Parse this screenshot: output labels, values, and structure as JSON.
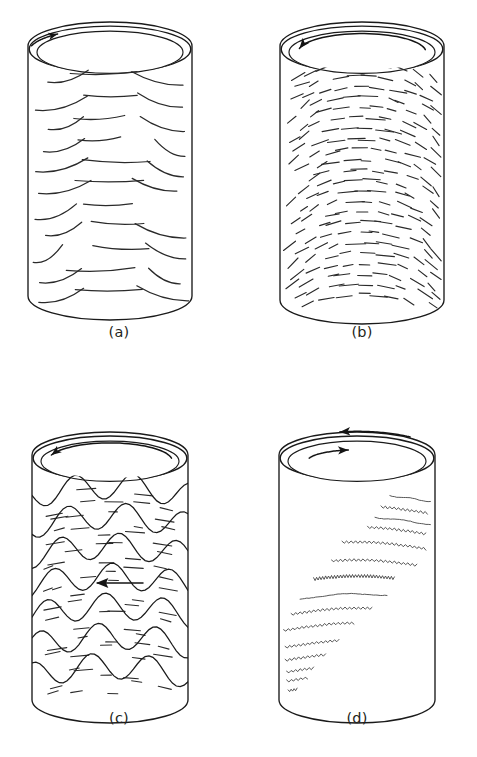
{
  "figure": {
    "background_color": "#ffffff",
    "ink_color": "#1a1a1a",
    "caption_color": "#231f20",
    "width": 477,
    "height": 757
  },
  "panels": [
    {
      "id": "a",
      "caption": "(a)",
      "caption_x": 119,
      "caption_y": 337,
      "structure_name": "parallel-lamination",
      "geometry": {
        "cx": 110,
        "top_y": 46,
        "bottom_y": 296,
        "radius_x": 82,
        "radius_y": 24,
        "rim_gap": 7,
        "inner_inset": 9
      },
      "texture": {
        "type": "sparse-curved-dashes",
        "rows": 11,
        "row_start_y": 74,
        "row_spacing": 21.5,
        "dashes_per_row": 3,
        "dash_length_center": 62,
        "dash_length_edge": 38,
        "stroke_width": 1.25,
        "jitter_seed": 11
      },
      "arrows": [
        {
          "name": "top-rim-flow-arrow",
          "style": "short-arc",
          "direction": "clockwise",
          "start_angle": 196,
          "sweep_angle": 34,
          "radius_scale": 0.995,
          "head_size": 4.6
        }
      ]
    },
    {
      "id": "b",
      "caption": "(b)",
      "caption_x": 362,
      "caption_y": 337,
      "structure_name": "dense-laminated-bioturbated",
      "geometry": {
        "cx": 362,
        "top_y": 46,
        "bottom_y": 300,
        "radius_x": 82,
        "radius_y": 24,
        "rim_gap": 7,
        "inner_inset": 9
      },
      "texture": {
        "type": "dense-short-dashes",
        "rows": 23,
        "row_start_y": 66,
        "row_spacing": 10.4,
        "dashes_per_row": 9,
        "dash_length_center": 17,
        "dash_length_edge": 12,
        "stroke_width": 1.15,
        "jitter_seed": 23
      },
      "arrows": [
        {
          "name": "top-rim-flow-arrow",
          "style": "long-arc",
          "direction": "counterclockwise",
          "start_angle": 352,
          "sweep_angle": 160,
          "radius_scale": 0.78,
          "head_size": 5.2
        }
      ]
    },
    {
      "id": "c",
      "caption": "(c)",
      "caption_x": 119,
      "caption_y": 723,
      "structure_name": "wavy-undulating-bedding",
      "geometry": {
        "cx": 110,
        "top_y": 455,
        "bottom_y": 700,
        "radius_x": 78,
        "radius_y": 23,
        "rim_gap": 7,
        "inner_inset": 9
      },
      "texture": {
        "type": "wavy-bedding-with-dashes",
        "bedding_count": 7,
        "bedding_start_y": 486,
        "bedding_spacing": 30,
        "wave_amplitude": 13,
        "wave_cycles": 1.35,
        "wave_phase": 0.35,
        "dash_rows_between": 2,
        "dashes_per_row": 5,
        "dash_length": 14,
        "stroke_width": 1.1,
        "jitter_seed": 37
      },
      "arrows": [
        {
          "name": "top-rim-flow-arrow",
          "style": "long-arc",
          "direction": "counterclockwise",
          "start_angle": 350,
          "sweep_angle": 150,
          "radius_scale": 0.8,
          "head_size": 5.0
        },
        {
          "name": "internal-direction-arrow",
          "style": "straight",
          "direction": "left",
          "x_start": 143,
          "x_end": 96,
          "y": 583,
          "head_size": 6.5
        }
      ]
    },
    {
      "id": "d",
      "caption": "(d)",
      "caption_x": 357,
      "caption_y": 723,
      "structure_name": "crinkled-laminae-cascade",
      "geometry": {
        "cx": 357,
        "top_y": 455,
        "bottom_y": 700,
        "radius_x": 78,
        "radius_y": 23,
        "rim_gap": 7,
        "inner_inset": 9
      },
      "texture": {
        "type": "crinkled-diagonal-cascade",
        "lines": [
          {
            "x_left": 0.72,
            "x_right": 0.99,
            "y": 494,
            "crinkle": "smooth"
          },
          {
            "x_left": 0.66,
            "x_right": 0.97,
            "y": 506,
            "crinkle": "fine"
          },
          {
            "x_left": 0.62,
            "x_right": 0.99,
            "y": 517,
            "crinkle": "smooth"
          },
          {
            "x_left": 0.57,
            "x_right": 0.96,
            "y": 527,
            "crinkle": "fine"
          },
          {
            "x_left": 0.4,
            "x_right": 0.96,
            "y": 542,
            "crinkle": "fine"
          },
          {
            "x_left": 0.33,
            "x_right": 0.9,
            "y": 560,
            "crinkle": "fine"
          },
          {
            "x_left": 0.21,
            "x_right": 0.75,
            "y": 576,
            "crinkle": "dense"
          },
          {
            "x_left": 0.12,
            "x_right": 0.7,
            "y": 594,
            "crinkle": "smooth"
          },
          {
            "x_left": 0.06,
            "x_right": 0.6,
            "y": 608,
            "crinkle": "fine"
          },
          {
            "x_left": 0.01,
            "x_right": 0.48,
            "y": 623,
            "crinkle": "fine"
          },
          {
            "x_left": 0.02,
            "x_right": 0.38,
            "y": 640,
            "crinkle": "fine"
          },
          {
            "x_left": 0.02,
            "x_right": 0.29,
            "y": 653,
            "crinkle": "fine"
          },
          {
            "x_left": 0.03,
            "x_right": 0.21,
            "y": 665,
            "crinkle": "fine"
          },
          {
            "x_left": 0.03,
            "x_right": 0.17,
            "y": 674,
            "crinkle": "fine"
          },
          {
            "x_left": 0.04,
            "x_right": 0.1,
            "y": 684,
            "crinkle": "fine"
          }
        ],
        "crinkle_amplitude_fine": 1.1,
        "crinkle_amplitude_dense": 1.5,
        "crinkle_wavelength_fine": 4.5,
        "crinkle_wavelength_dense": 3.0,
        "stroke_width": 0.85,
        "jitter_seed": 53
      },
      "arrows": [
        {
          "name": "outer-rim-flow-arrow",
          "style": "outer-arc",
          "direction": "counterclockwise",
          "start_angle": 310,
          "sweep_angle": 52,
          "radius_scale": 1.06,
          "head_size": 5.2
        },
        {
          "name": "inner-rim-flow-arrow",
          "style": "inner-arc",
          "direction": "clockwise",
          "start_angle": 196,
          "sweep_angle": 64,
          "radius_scale": 0.72,
          "head_size": 5.2
        }
      ]
    }
  ]
}
